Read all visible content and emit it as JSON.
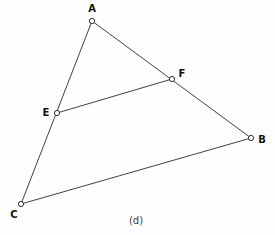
{
  "figure": {
    "caption": "(d)",
    "caption_position": {
      "x": 136,
      "y": 220
    },
    "width": 275,
    "height": 235,
    "background_color": "#fefefe",
    "line_color": "#2b2b2b",
    "marker_fill_color": "#ffffff",
    "marker_stroke_color": "#1a1a1a",
    "label_color": "#111111"
  },
  "chart_data": {
    "type": "scatter",
    "title": "(d)",
    "xlabel": "",
    "ylabel": "",
    "grid": false,
    "legend": "none",
    "xlim": [
      0,
      275
    ],
    "ylim": [
      0,
      235
    ],
    "points": [
      {
        "name": "A",
        "x": 92,
        "y": 21,
        "label_x": 92,
        "label_y": 9
      },
      {
        "name": "B",
        "x": 251,
        "y": 138,
        "label_x": 262,
        "label_y": 140
      },
      {
        "name": "C",
        "x": 21,
        "y": 204,
        "label_x": 14,
        "label_y": 215
      },
      {
        "name": "E",
        "x": 57,
        "y": 113,
        "label_x": 46,
        "label_y": 113
      },
      {
        "name": "F",
        "x": 172,
        "y": 79,
        "label_x": 182,
        "label_y": 74
      }
    ],
    "edges": [
      {
        "name": "A-C",
        "from": "A",
        "to": "C"
      },
      {
        "name": "A-B",
        "from": "A",
        "to": "B"
      },
      {
        "name": "C-B",
        "from": "C",
        "to": "B"
      },
      {
        "name": "E-F",
        "from": "E",
        "to": "F"
      }
    ],
    "marker_radius": 2.6,
    "labels": [
      "A",
      "B",
      "C",
      "E",
      "F"
    ]
  }
}
